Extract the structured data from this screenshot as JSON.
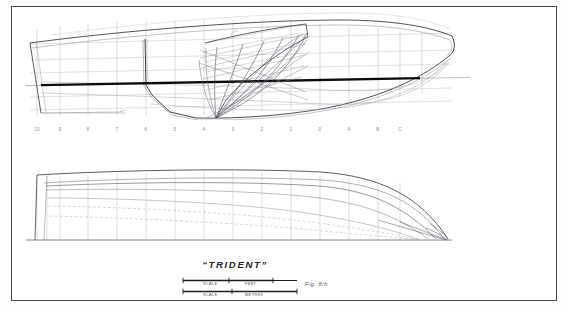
{
  "sheet": {
    "background": "#ffffff",
    "border_color": "#4a4a4a"
  },
  "drawing": {
    "type": "lines-plan",
    "ink_color": "#3a3a42",
    "faint_color": "#b9b9c1",
    "waterline_color": "#111111",
    "views": [
      {
        "name": "sheer-profile-with-body-plan",
        "label": "",
        "bow_side": "right",
        "stern_side": "left"
      },
      {
        "name": "half-breadth-plan",
        "label": "",
        "bow_side": "right",
        "stern_side": "left"
      }
    ]
  },
  "stations": {
    "labels": [
      "10",
      "9",
      "8",
      "7",
      "6",
      "5",
      "4",
      "3",
      "2",
      "1",
      "0",
      "A",
      "B",
      "C"
    ],
    "x_positions": [
      37,
      60,
      88,
      117,
      146,
      175,
      204,
      233,
      262,
      291,
      320,
      349,
      378,
      400
    ]
  },
  "title_block": {
    "ship_name": "“TRIDENT”",
    "figure_label": "Fig. 8/b",
    "scales": [
      {
        "name": "scale-feet",
        "word": "SCALE",
        "unit": "FEET"
      },
      {
        "name": "scale-metres",
        "word": "SCALE",
        "unit": "METRES"
      }
    ]
  }
}
